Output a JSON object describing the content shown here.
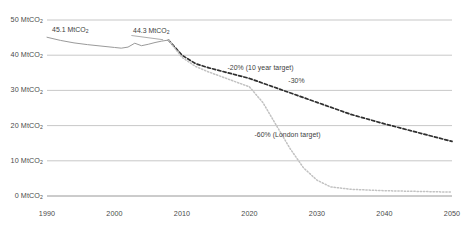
{
  "chart_data": {
    "type": "line",
    "title": "",
    "xlabel": "",
    "ylabel": "",
    "unit": "MtCO2",
    "xlim": [
      1990,
      2050
    ],
    "ylim": [
      0,
      50
    ],
    "grid": true,
    "legend_position": "none",
    "x_ticks": [
      "1990",
      "2000",
      "2010",
      "2020",
      "2030",
      "2040",
      "2050"
    ],
    "y_ticks": [
      "0",
      "10",
      "20",
      "30",
      "40",
      "50"
    ],
    "y_tick_labels": [
      "0 MtCO",
      "10 MtCO",
      "20 MtCO",
      "30 MtCO",
      "40 MtCO",
      "50 MtCO"
    ],
    "y_tick_subscript": "2",
    "series": [
      {
        "name": "Historical emissions",
        "style": "solid-grey",
        "color": "#9a9a9a",
        "x": [
          1990,
          1992,
          1994,
          1996,
          1998,
          2000,
          2001,
          2002,
          2003,
          2004,
          2005,
          2006,
          2007,
          2008
        ],
        "values": [
          45.1,
          44.2,
          43.5,
          43.0,
          42.6,
          42.2,
          42.0,
          42.3,
          43.4,
          42.7,
          43.1,
          43.6,
          44.0,
          44.3
        ]
      },
      {
        "name": "-20% (10 year target) trajectory",
        "style": "dashed-dark",
        "color": "#2f2f2f",
        "x": [
          2008,
          2010,
          2012,
          2014,
          2016,
          2018,
          2020,
          2025,
          2030,
          2035,
          2040,
          2045,
          2050
        ],
        "values": [
          44.3,
          40.0,
          37.6,
          36.4,
          35.4,
          34.4,
          33.4,
          30.0,
          26.6,
          23.2,
          20.5,
          18.0,
          15.5
        ]
      },
      {
        "name": "-60% (London target) trajectory",
        "style": "dotted-light",
        "color": "#c2c2c2",
        "x": [
          2008,
          2010,
          2012,
          2014,
          2016,
          2018,
          2020,
          2022,
          2024,
          2026,
          2028,
          2030,
          2032,
          2035,
          2040,
          2045,
          2050
        ],
        "values": [
          44.3,
          39.4,
          36.8,
          35.2,
          33.8,
          32.4,
          31.0,
          26.5,
          20.0,
          13.5,
          8.0,
          4.5,
          2.6,
          1.9,
          1.5,
          1.3,
          1.1
        ]
      }
    ],
    "annotations": [
      {
        "name": "start-value",
        "text": "45.1 MtCO",
        "subscript": "2",
        "x": 1994,
        "y": 46.8
      },
      {
        "name": "peak-value",
        "text": "44.3 MtCO",
        "subscript": "2",
        "x": 2006,
        "y": 46.5
      },
      {
        "name": "ten-year-target",
        "text": "-20% (10 year target)",
        "x": 2020,
        "y": 36.2
      },
      {
        "name": "thirty-percent",
        "text": "-30%",
        "x": 2029,
        "y": 32.5
      },
      {
        "name": "london-target",
        "text": "-60% (London target)",
        "x": 2024,
        "y": 17.0
      }
    ]
  }
}
